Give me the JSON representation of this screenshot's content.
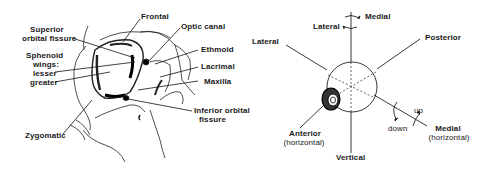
{
  "left_figure": {
    "subject": "Bones of the orbit",
    "labels": {
      "frontal": "Frontal",
      "optic_canal": "Optic canal",
      "superior_orbital_fissure_1": "Superior",
      "superior_orbital_fissure_2": "orbital fissure",
      "sphenoid_1": "Sphenoid",
      "sphenoid_2": "wings:",
      "lesser": "lesser",
      "greater": "greater",
      "ethmoid": "Ethmoid",
      "lacrimal": "Lacrimal",
      "maxilla": "Maxilla",
      "inferior_orbital_fissure_1": "Inferior orbital",
      "inferior_orbital_fissure_2": "fissure",
      "zygomatic": "Zygomatic"
    }
  },
  "right_figure": {
    "subject": "Axes of eye rotation",
    "labels": {
      "top_medial": "Medial",
      "top_lateral": "Lateral",
      "lateral": "Lateral",
      "posterior": "Posterior",
      "anterior_1": "Anterior",
      "anterior_2": "(horizontal)",
      "vertical": "Vertical",
      "up": "up",
      "down": "down",
      "medial_h_1": "Medial",
      "medial_h_2": "(horizontal)"
    }
  }
}
